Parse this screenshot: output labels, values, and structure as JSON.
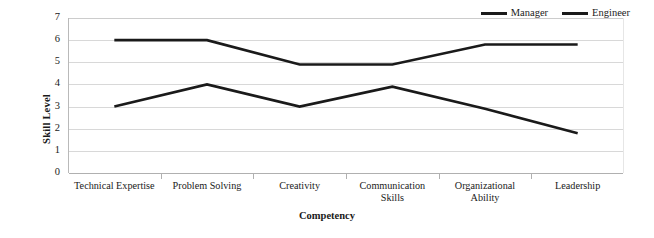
{
  "chart_data": {
    "type": "line",
    "title": "",
    "xlabel": "Competency",
    "ylabel": "Skill Level",
    "ylim": [
      0,
      7
    ],
    "ytick_labels": [
      "0",
      "1",
      "2",
      "3",
      "4",
      "5",
      "6",
      "7"
    ],
    "grid": true,
    "legend_position": "top-right",
    "categories": [
      "Technical Expertise",
      "Problem Solving",
      "Creativity",
      "Communication\nSkills",
      "Organizational\nAbility",
      "Leadership"
    ],
    "series": [
      {
        "name": "Manager",
        "color": "#1a1a1a",
        "values": [
          3,
          4,
          3,
          3.9,
          2.9,
          1.8
        ]
      },
      {
        "name": "Engineer",
        "color": "#1a1a1a",
        "values": [
          6,
          6,
          4.9,
          4.9,
          5.8,
          5.8
        ]
      }
    ]
  },
  "legend": {
    "entries": [
      {
        "label": "Manager"
      },
      {
        "label": "Engineer"
      }
    ]
  },
  "colors": {
    "line": "#1a1a1a",
    "grid": "#d8d8d8",
    "axis": "#b0b0b0",
    "background": "#ffffff"
  }
}
